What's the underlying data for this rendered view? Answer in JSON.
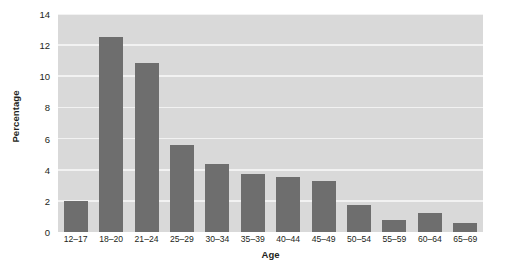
{
  "chart_data": {
    "type": "bar",
    "title": "",
    "subtitle": "",
    "xlabel": "Age",
    "ylabel": "Percentage",
    "categories": [
      "12–17",
      "18–20",
      "21–24",
      "25–29",
      "30–34",
      "35–39",
      "40–44",
      "45–49",
      "50–54",
      "55–59",
      "60–64",
      "65–69"
    ],
    "values": [
      2.0,
      12.5,
      10.85,
      5.6,
      4.35,
      3.7,
      3.55,
      3.3,
      1.75,
      0.8,
      1.25,
      0.55
    ],
    "ylim": [
      0,
      14
    ],
    "yticks": [
      0,
      2,
      4,
      6,
      8,
      10,
      12,
      14
    ],
    "ytick_labels": [
      "0",
      "2",
      "4",
      "6",
      "8",
      "10",
      "12",
      "14"
    ],
    "grid": "horizontal",
    "legend": "none",
    "series": [
      {
        "name": "Percentage",
        "values": [
          2.0,
          12.5,
          10.85,
          5.6,
          4.35,
          3.7,
          3.55,
          3.3,
          1.75,
          0.8,
          1.25,
          0.55
        ]
      }
    ],
    "colors": {
      "bar": "#6e6e6e",
      "plot_background": "#d9d9d9",
      "gridline": "#f2f2f2",
      "text": "#231f20",
      "figure_background": "#ffffff"
    }
  }
}
